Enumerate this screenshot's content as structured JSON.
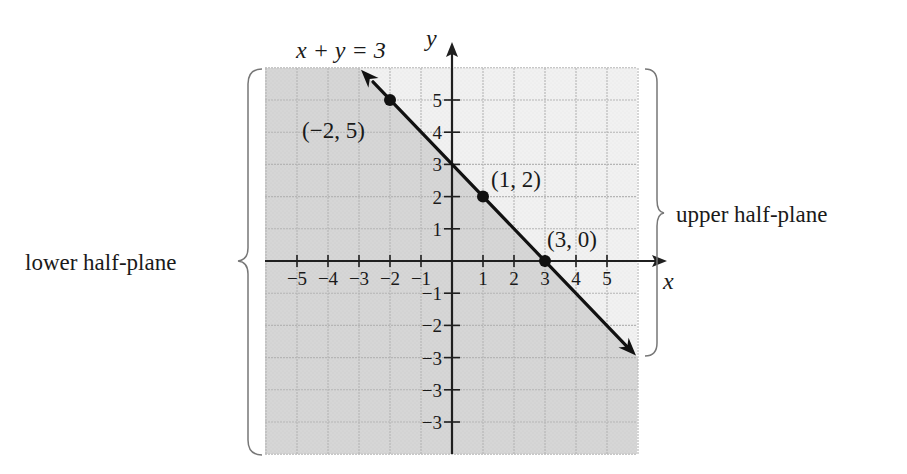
{
  "figure": {
    "equation_label": "x + y = 3",
    "x_axis_label": "x",
    "y_axis_label": "y",
    "upper_region_label": "upper half-plane",
    "lower_region_label": "lower half-plane",
    "x_tick_labels": [
      "−5",
      "−4",
      "−3",
      "−2",
      "−1",
      "1",
      "2",
      "3",
      "4",
      "5"
    ],
    "y_tick_labels_positive": [
      "1",
      "2",
      "3",
      "4",
      "5"
    ],
    "y_tick_labels_negative": [
      "−1",
      "−2",
      "−3",
      "−3",
      "−3"
    ],
    "points": [
      {
        "label": "(−2, 5)",
        "x": -2,
        "y": 5
      },
      {
        "label": "(1, 2)",
        "x": 1,
        "y": 2
      },
      {
        "label": "(3, 0)",
        "x": 3,
        "y": 0
      }
    ],
    "colors": {
      "shaded_region": "#d6d6d6",
      "unshaded_region": "#f1f1f1",
      "grid_line": "#b5b5b5",
      "axis": "#1f1f1f",
      "line": "#111111",
      "brace": "#777777"
    }
  },
  "chart_data": {
    "type": "line",
    "title": "x + y = 3",
    "xlabel": "x",
    "ylabel": "y",
    "xlim": [
      -6,
      6
    ],
    "ylim": [
      -6,
      6
    ],
    "grid": true,
    "series": [
      {
        "name": "x + y = 3",
        "x": [
          -3,
          -2,
          1,
          3,
          6
        ],
        "y": [
          6,
          5,
          2,
          0,
          -3
        ]
      }
    ],
    "labeled_points": [
      {
        "label": "(−2, 5)",
        "x": -2,
        "y": 5
      },
      {
        "label": "(1, 2)",
        "x": 1,
        "y": 2
      },
      {
        "label": "(3, 0)",
        "x": 3,
        "y": 0
      }
    ],
    "regions": [
      {
        "label": "upper half-plane",
        "inequality": "x + y > 3",
        "shading": "light"
      },
      {
        "label": "lower half-plane",
        "inequality": "x + y < 3",
        "shading": "dark"
      }
    ],
    "annotations": [
      "x + y = 3",
      "upper half-plane",
      "lower half-plane"
    ]
  }
}
